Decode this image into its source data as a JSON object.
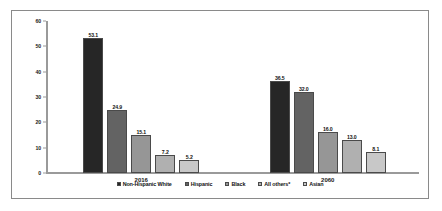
{
  "chart_data": {
    "type": "bar",
    "title": "",
    "xlabel": "",
    "ylabel": "",
    "categories": [
      "2016",
      "2060"
    ],
    "ylim": [
      0,
      60
    ],
    "yticks": [
      "0",
      "10",
      "20",
      "30",
      "40",
      "50",
      "60"
    ],
    "grid": false,
    "legend_position": "bottom",
    "series": [
      {
        "name": "Non-Hispanic White",
        "color": "#262626",
        "values": [
          53.1,
          36.5
        ]
      },
      {
        "name": "Hispanic",
        "color": "#636363",
        "values": [
          24.9,
          32.0
        ]
      },
      {
        "name": "Black",
        "color": "#969696",
        "values": [
          15.1,
          16.0
        ]
      },
      {
        "name": "All others*",
        "color": "#b0b0b0",
        "values": [
          7.2,
          13.0
        ]
      },
      {
        "name": "Asian",
        "color": "#c8c8c8",
        "values": [
          5.2,
          8.1
        ]
      }
    ]
  }
}
